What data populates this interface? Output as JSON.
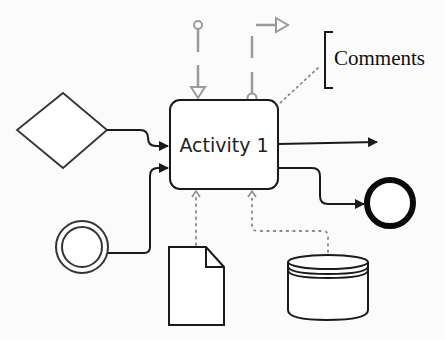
{
  "diagram": {
    "type": "bpmn-activity-notation",
    "activity": {
      "label": "Activity 1"
    },
    "annotation": {
      "label": "Comments"
    },
    "elements": [
      {
        "id": "gateway",
        "shape": "diamond"
      },
      {
        "id": "intermediate-event",
        "shape": "double-circle"
      },
      {
        "id": "end-event",
        "shape": "thick-circle"
      },
      {
        "id": "data-object",
        "shape": "document"
      },
      {
        "id": "data-store",
        "shape": "cylinder"
      }
    ],
    "colors": {
      "line": "#1a1a1a",
      "message_flow": "#9a9a9a",
      "association": "#888888"
    }
  }
}
